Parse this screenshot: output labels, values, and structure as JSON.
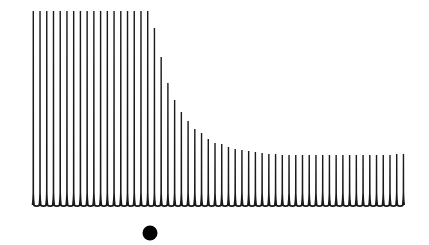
{
  "chart_data": {
    "type": "bar",
    "title": "",
    "xlabel": "",
    "ylabel": "",
    "grid": false,
    "legend": null,
    "baseline_y_px": 205,
    "first_bar_x_px": 33.3,
    "bar_spacing_px": 6.73,
    "bar_color": "#1a1a1a",
    "marker": {
      "shape": "dot",
      "x_px": 150,
      "y_px": 233,
      "radius_px": 7.5,
      "color": "#000000"
    },
    "ylim": [
      0,
      195
    ],
    "values": [
      195,
      195,
      195,
      195,
      195,
      195,
      195,
      195,
      195,
      195,
      195,
      195,
      195,
      195,
      195,
      195,
      195,
      195,
      178,
      149,
      123,
      106,
      94,
      85,
      77,
      73,
      67,
      63,
      62,
      59,
      57,
      56,
      55,
      54,
      53,
      52,
      52,
      51,
      51,
      51,
      51,
      51,
      51,
      51,
      51,
      51,
      51,
      51,
      51,
      51,
      51,
      51,
      51,
      51,
      52,
      52
    ]
  }
}
